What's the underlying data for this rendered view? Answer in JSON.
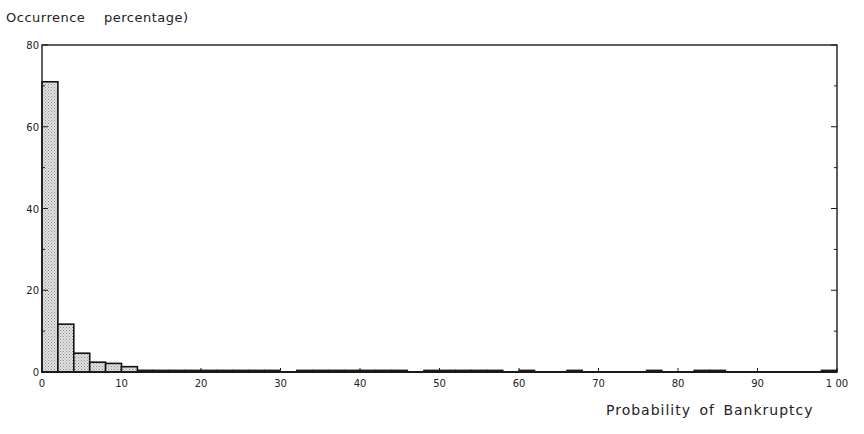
{
  "chart_data": {
    "type": "bar",
    "title": "",
    "xlabel": "Probability of Bankruptcy",
    "ylabel": "Occurrence  percentage)",
    "xlim": [
      0,
      100
    ],
    "ylim": [
      0,
      80
    ],
    "grid": false,
    "legend": null,
    "bin_width": 2,
    "x_ticks": [
      0,
      10,
      20,
      30,
      40,
      50,
      60,
      70,
      80,
      90,
      100
    ],
    "x_tick_labels": [
      "0",
      "10",
      "20",
      "30",
      "40",
      "50",
      "60",
      "70",
      "80",
      "90",
      "1 00"
    ],
    "y_ticks": [
      0,
      20,
      40,
      60,
      80
    ],
    "y_tick_labels": [
      "0",
      "20",
      "40",
      "60",
      "80"
    ],
    "categories": [
      "0-2",
      "2-4",
      "4-6",
      "6-8",
      "8-10",
      "10-12",
      "12-14",
      "14-16",
      "16-18",
      "18-20",
      "20-22",
      "22-24",
      "24-26",
      "26-28",
      "28-30",
      "32-34",
      "34-36",
      "36-38",
      "38-40",
      "40-42",
      "42-44",
      "44-46",
      "48-50",
      "50-52",
      "52-54",
      "54-56",
      "56-58",
      "60-62",
      "66-68",
      "76-78",
      "82-84",
      "84-86",
      "98-100"
    ],
    "bins": [
      {
        "x0": 0,
        "x1": 2,
        "value": 71.0
      },
      {
        "x0": 2,
        "x1": 4,
        "value": 11.7
      },
      {
        "x0": 4,
        "x1": 6,
        "value": 4.6
      },
      {
        "x0": 6,
        "x1": 8,
        "value": 2.4
      },
      {
        "x0": 8,
        "x1": 10,
        "value": 2.1
      },
      {
        "x0": 10,
        "x1": 12,
        "value": 1.3
      },
      {
        "x0": 12,
        "x1": 14,
        "value": 0.5
      },
      {
        "x0": 14,
        "x1": 16,
        "value": 0.3
      },
      {
        "x0": 16,
        "x1": 18,
        "value": 0.3
      },
      {
        "x0": 18,
        "x1": 20,
        "value": 0.4
      },
      {
        "x0": 20,
        "x1": 22,
        "value": 0.3
      },
      {
        "x0": 22,
        "x1": 24,
        "value": 0.3
      },
      {
        "x0": 24,
        "x1": 26,
        "value": 0.3
      },
      {
        "x0": 26,
        "x1": 28,
        "value": 0.3
      },
      {
        "x0": 28,
        "x1": 30,
        "value": 0.3
      },
      {
        "x0": 32,
        "x1": 34,
        "value": 0.3
      },
      {
        "x0": 34,
        "x1": 36,
        "value": 0.3
      },
      {
        "x0": 36,
        "x1": 38,
        "value": 0.3
      },
      {
        "x0": 38,
        "x1": 40,
        "value": 0.3
      },
      {
        "x0": 40,
        "x1": 42,
        "value": 0.4
      },
      {
        "x0": 42,
        "x1": 44,
        "value": 0.4
      },
      {
        "x0": 44,
        "x1": 46,
        "value": 0.4
      },
      {
        "x0": 48,
        "x1": 50,
        "value": 0.4
      },
      {
        "x0": 50,
        "x1": 52,
        "value": 0.3
      },
      {
        "x0": 52,
        "x1": 54,
        "value": 0.3
      },
      {
        "x0": 54,
        "x1": 56,
        "value": 0.3
      },
      {
        "x0": 56,
        "x1": 58,
        "value": 0.4
      },
      {
        "x0": 60,
        "x1": 62,
        "value": 0.3
      },
      {
        "x0": 66,
        "x1": 68,
        "value": 0.4
      },
      {
        "x0": 76,
        "x1": 78,
        "value": 0.4
      },
      {
        "x0": 82,
        "x1": 84,
        "value": 0.3
      },
      {
        "x0": 84,
        "x1": 86,
        "value": 0.3
      },
      {
        "x0": 98,
        "x1": 100,
        "value": 0.4
      }
    ],
    "values": [
      71.0,
      11.7,
      4.6,
      2.4,
      2.1,
      1.3,
      0.5,
      0.3,
      0.3,
      0.4,
      0.3,
      0.3,
      0.3,
      0.3,
      0.3,
      0.3,
      0.3,
      0.3,
      0.3,
      0.4,
      0.4,
      0.4,
      0.4,
      0.3,
      0.3,
      0.3,
      0.4,
      0.3,
      0.4,
      0.4,
      0.3,
      0.3,
      0.4
    ],
    "bar_fill": "stippled light gray",
    "bar_edge": "#111111"
  },
  "labels": {
    "y_axis_title": "Occurrence  percentage)",
    "x_axis_title": "Probability of Bankruptcy"
  },
  "colors": {
    "axis": "#1a1a1a",
    "bar_fill": "#d9d9d9",
    "bar_stipple": "#8a8a8a",
    "background": "#ffffff"
  }
}
